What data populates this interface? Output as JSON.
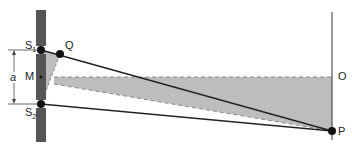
{
  "diagram": {
    "type": "double-slit interference geometry",
    "labels": {
      "S1": "S",
      "S1_sub": "1",
      "S2": "S",
      "S2_sub": "2",
      "Q": "Q",
      "M": "M",
      "a": "a",
      "O": "O",
      "P": "P"
    },
    "colors": {
      "barrier": "#555555",
      "shading": "#bdbdbd",
      "line": "#222222",
      "dashed": "#8a8a8a",
      "point": "#111111"
    }
  }
}
